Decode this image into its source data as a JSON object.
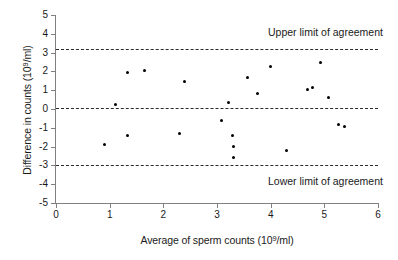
{
  "chart_data": {
    "type": "scatter",
    "title": "",
    "xlabel": "Average of sperm counts (10⁹/ml)",
    "ylabel": "Difference in counts (10⁹/ml)",
    "xlabel_parts": {
      "pre": "Average of sperm counts (10",
      "sup": "9",
      "post": "/ml)"
    },
    "ylabel_parts": {
      "pre": "Difference in counts (10",
      "sup": "9",
      "post": "/ml)"
    },
    "xlim": [
      0,
      6
    ],
    "ylim": [
      -5,
      5
    ],
    "xticks": [
      0,
      1,
      2,
      3,
      4,
      5,
      6
    ],
    "xtick_labels": [
      "0",
      "1",
      "2",
      "3",
      "4",
      "5",
      "6"
    ],
    "yticks": [
      -5,
      -4,
      -3,
      -2,
      -1,
      0,
      1,
      2,
      3,
      4,
      5
    ],
    "ytick_labels": [
      "-5",
      "-4",
      "-3",
      "-2",
      "-1",
      "0",
      "1",
      "2",
      "3",
      "4",
      "5"
    ],
    "grid": false,
    "legend": false,
    "marker": "filled-circle",
    "marker_color": "#000000",
    "reference_lines": [
      {
        "name": "upper-limit-of-agreement",
        "y": 3.2,
        "label": "Upper limit of agreement",
        "style": "dashed",
        "color": "#2b2b2b",
        "label_x": 3.95,
        "label_y": 4.05
      },
      {
        "name": "mean-difference",
        "y": 0.05,
        "label": "",
        "style": "dashed",
        "color": "#2b2b2b"
      },
      {
        "name": "lower-limit-of-agreement",
        "y": -3.0,
        "label": "Lower limit of agreement",
        "style": "dashed",
        "color": "#2b2b2b",
        "label_x": 3.95,
        "label_y": -3.9
      }
    ],
    "points": [
      {
        "x": 0.9,
        "y": -1.9
      },
      {
        "x": 1.1,
        "y": 0.25
      },
      {
        "x": 1.33,
        "y": 1.95
      },
      {
        "x": 1.34,
        "y": -1.4
      },
      {
        "x": 1.65,
        "y": 2.05
      },
      {
        "x": 2.3,
        "y": -1.3
      },
      {
        "x": 2.39,
        "y": 1.45
      },
      {
        "x": 3.09,
        "y": -0.6
      },
      {
        "x": 3.21,
        "y": 0.35
      },
      {
        "x": 3.29,
        "y": -1.4
      },
      {
        "x": 3.3,
        "y": -2.0
      },
      {
        "x": 3.31,
        "y": -2.6
      },
      {
        "x": 3.57,
        "y": 1.65
      },
      {
        "x": 3.75,
        "y": 0.8
      },
      {
        "x": 3.99,
        "y": 2.25
      },
      {
        "x": 4.3,
        "y": -2.2
      },
      {
        "x": 4.69,
        "y": 1.05
      },
      {
        "x": 4.78,
        "y": 1.15
      },
      {
        "x": 4.92,
        "y": 2.45
      },
      {
        "x": 5.08,
        "y": 0.6
      },
      {
        "x": 5.27,
        "y": -0.85
      },
      {
        "x": 5.37,
        "y": -0.95
      }
    ]
  }
}
